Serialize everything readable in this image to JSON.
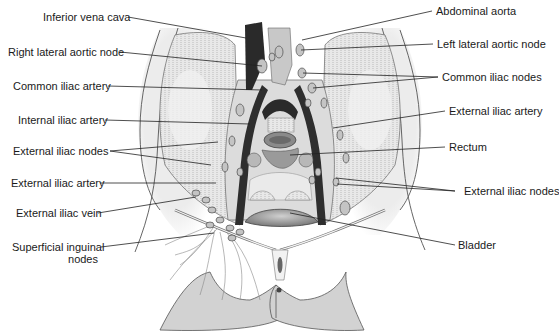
{
  "diagram": {
    "type": "anatomical-illustration",
    "colors": {
      "skin": "#d6d6d6",
      "skin_outline": "#555555",
      "vein_dark": "#2a2a2a",
      "node_fill": "#c4c4c4",
      "node_stroke": "#4a4a4a",
      "muscle": "#e4e4e4",
      "rectum": "#8a8a8a",
      "bladder": "#9a9a9a",
      "leader_line": "#222222",
      "label_text": "#1a1a1a"
    },
    "labels_left": [
      {
        "id": "inferior-vena-cava",
        "text": "Inferior vena cava"
      },
      {
        "id": "right-lateral-aortic-node",
        "text": "Right lateral aortic node"
      },
      {
        "id": "common-iliac-artery-left",
        "text": "Common iliac artery"
      },
      {
        "id": "internal-iliac-artery",
        "text": "Internal iliac artery"
      },
      {
        "id": "external-iliac-nodes-left",
        "text": "External iliac nodes"
      },
      {
        "id": "external-iliac-artery-left",
        "text": "External iliac artery"
      },
      {
        "id": "external-iliac-vein",
        "text": "External iliac vein"
      },
      {
        "id": "superficial-inguinal-nodes",
        "text_line1": "Superficial inguinal",
        "text_line2": "nodes"
      }
    ],
    "labels_right": [
      {
        "id": "abdominal-aorta",
        "text": "Abdominal aorta"
      },
      {
        "id": "left-lateral-aortic-node",
        "text": "Left lateral aortic node"
      },
      {
        "id": "common-iliac-nodes",
        "text": "Common iliac nodes"
      },
      {
        "id": "external-iliac-artery-right",
        "text": "External iliac artery"
      },
      {
        "id": "rectum",
        "text": "Rectum"
      },
      {
        "id": "external-iliac-nodes-right",
        "text": "External iliac nodes"
      },
      {
        "id": "bladder",
        "text": "Bladder"
      }
    ]
  }
}
